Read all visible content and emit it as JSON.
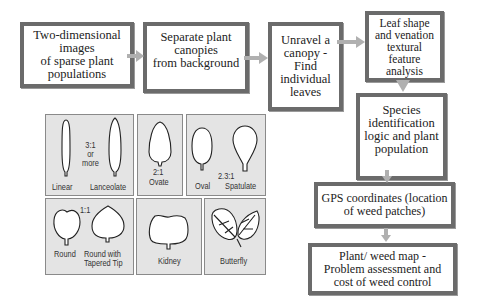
{
  "flow": {
    "steps": [
      {
        "id": "images",
        "label": "Two-dimensional\nimages\nof sparse plant\npopulations"
      },
      {
        "id": "separate",
        "label": "Separate plant\ncanopies\nfrom background"
      },
      {
        "id": "unravel",
        "label": "Unravel a\ncanopy -\nFind\nindividual\nleaves"
      },
      {
        "id": "analysis",
        "label": "Leaf shape\nand venation\ntextural\nfeature\nanalysis"
      },
      {
        "id": "species",
        "label": "Species\nidentification\nlogic and plant\npopulation"
      },
      {
        "id": "gps",
        "label": "GPS coordinates (location\nof weed patches)"
      },
      {
        "id": "map",
        "label": "Plant/ weed map -\nProblem assessment and\ncost of weed control"
      }
    ],
    "arrow_color": "#b0b0b0",
    "border_color": "#6b6b6b"
  },
  "leaf_shapes": {
    "ratios": {
      "linear_lanceolate": "3:1\nor\nmore",
      "ovate": "2:1",
      "spatulate": "2.3:1",
      "round": "1:1"
    },
    "labels": {
      "linear": "Linear",
      "lanceolate": "Lanceolate",
      "ovate": "Ovate",
      "oval": "Oval",
      "spatulate": "Spatulate",
      "round": "Round",
      "round_tapered": "Round with\nTapered Tip",
      "kidney": "Kidney",
      "butterfly": "Butterfly"
    },
    "panel_color": "#e4e4e4"
  }
}
